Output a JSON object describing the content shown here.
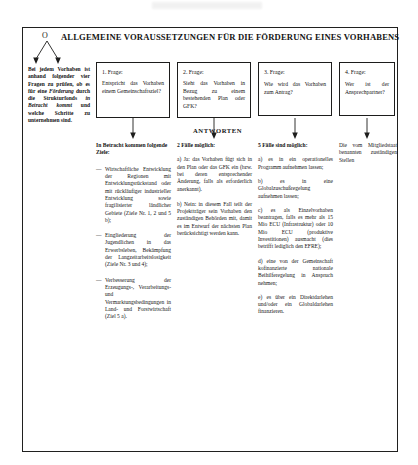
{
  "document": {
    "title": "ALLGEMEINE VORAUSSETZUNGEN FÜR DIE FÖRDERUNG EINES VORHABENS",
    "origin_marker": "O",
    "answers_label": "ANTWORTEN"
  },
  "intro": {
    "line1": "Bei jedem Vorhaben ist anhand folgender vier Fragen zu prüfen, ob es für eine ",
    "em1": "Förderung",
    "line2": " durch die Strukturfonds ",
    "em2": "in Betracht kommt",
    "line3": " und welche Schritte zu unternehmen sind."
  },
  "questions": [
    {
      "label": "1. Frage:",
      "text": "Entspricht das Vorhaben einem Gemeinschaftsziel?"
    },
    {
      "label": "2. Frage:",
      "text": "Sieht das Vorhaben in Bezug zu einem bestehenden Plan oder GFK?"
    },
    {
      "label": "3. Frage:",
      "text": "Wie wird das Vorhaben zum Antrag?"
    },
    {
      "label": "4. Frage:",
      "text": "Wer ist der Ansprechpartner?"
    }
  ],
  "answers": {
    "col1": {
      "heading": "In Betracht kommen folgende Ziele:",
      "items": [
        {
          "dash": "—",
          "pre": "Wirtschaftliche Entwicklung der Regionen mit Entwicklungsrückstand oder mit rückläufiger industrieller Entwicklung sowie fragilisierter ländlicher Gebiete (Ziele Nr. 1, 2 und 5 b);"
        },
        {
          "dash": "—",
          "pre": "Eingliederung der Jugendlichen in das Erwerbsleben, Bekämpfung der Langzeitarbeitslosigkeit (Ziele Nr. 3 und 4);"
        },
        {
          "dash": "—",
          "pre": "Verbesserung der Erzeugungs-, Verarbeitungs- und Vermarktungsbedingungen in Land- und Forstwirtschaft (Ziel 5 a)."
        }
      ]
    },
    "col2": {
      "heading": "2 Fälle möglich:",
      "items": [
        "a) Ja: das Vorhaben fügt sich in den Plan oder das GFK ein (bzw. bei deren entsprechender Änderung, falls als erforderlich anerkannt).",
        "b) Nein: in diesem Fall teilt der Projektträger sein Vorhaben den zuständigen Behörden mit, damit es im Entwurf der nächsten Plan berücksichtigt werden kann."
      ]
    },
    "col3": {
      "heading": "5 Fälle sind möglich:",
      "items": [
        "a) es in ein operationelles Programm aufnehmen lassen;",
        "b) es in eine Globalzuschußregelung aufnehmen lassen;",
        "c) es als Einzelvorhaben beantragen, falls es mehr als 15 Mio ECU (Infrastruktur) oder 10 Mio ECU (produktive Investitionen) ausmacht (dies betrifft lediglich den EFRE);",
        "d) eine von der Gemeinschaft kofinanzierte nationale Beihilferegelung in Anspruch nehmen;",
        "e) es über ein Direktdarlehen und/oder ein Globaldarlehen finanzieren."
      ]
    },
    "col4": {
      "heading": "Die vom Mitgliedstaat benannten zuständigen Stellen"
    }
  }
}
